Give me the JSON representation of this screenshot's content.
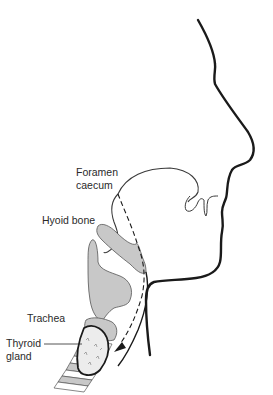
{
  "diagram": {
    "type": "anatomical-illustration",
    "labels": {
      "foramen_caecum_line1": "Foramen",
      "foramen_caecum_line2": "caecum",
      "hyoid_bone": "Hyoid bone",
      "trachea": "Trachea",
      "thyroid_gland_line1": "Thyroid",
      "thyroid_gland_line2": "gland"
    },
    "colors": {
      "outline": "#1a1a1a",
      "structure_fill": "#c8c8c8",
      "thyroid_fill": "#ececec",
      "background": "#ffffff"
    }
  }
}
